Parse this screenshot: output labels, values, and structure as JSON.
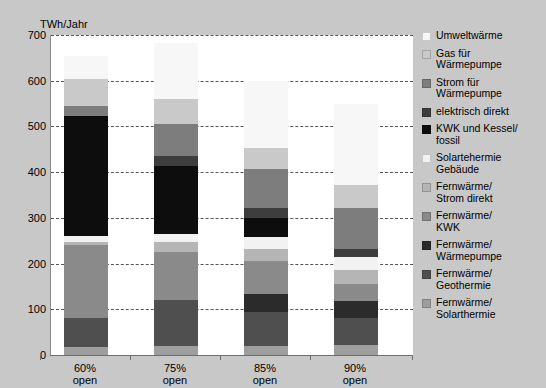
{
  "chart_data": {
    "type": "bar",
    "stacked": true,
    "title": "",
    "xlabel": "",
    "ylabel": "TWh/Jahr",
    "ylim": [
      0,
      700
    ],
    "ytick_step": 100,
    "yticks": [
      "700",
      "600",
      "500",
      "400",
      "300",
      "200",
      "100",
      "0"
    ],
    "grid": true,
    "legend_position": "right",
    "categories": [
      "60%\nopen",
      "75%\nopen",
      "85%\nopen",
      "90%\nopen"
    ],
    "category_labels": [
      {
        "line1": "60%",
        "line2": "open"
      },
      {
        "line1": "75%",
        "line2": "open"
      },
      {
        "line1": "85%",
        "line2": "open"
      },
      {
        "line1": "90%",
        "line2": "open"
      }
    ],
    "totals": [
      655,
      683,
      600,
      550
    ],
    "series": [
      {
        "name": "Fernwärme/\nSolarthermie",
        "color": "#9e9e9e",
        "values": [
          18,
          20,
          20,
          22
        ]
      },
      {
        "name": "Fernwärme/\nGeothermie",
        "color": "#4f4f4f",
        "values": [
          62,
          100,
          75,
          58
        ]
      },
      {
        "name": "Fernwärme/\nWärmepumpe",
        "color": "#2b2b2b",
        "values": [
          0,
          0,
          38,
          38
        ]
      },
      {
        "name": "Fernwärme/\nKWK",
        "color": "#8a8a8a",
        "values": [
          160,
          105,
          72,
          37
        ]
      },
      {
        "name": "Fernwärme/\nStrom direkt",
        "color": "#b5b5b5",
        "values": [
          8,
          22,
          28,
          32
        ]
      },
      {
        "name": "Solartehermie\nGebäude",
        "color": "#f2f2f2",
        "values": [
          12,
          18,
          25,
          28
        ]
      },
      {
        "name": "KWK und Kessel/\nfossil",
        "color": "#0d0d0d",
        "values": [
          262,
          148,
          42,
          0
        ]
      },
      {
        "name": "elektrisch direkt",
        "color": "#3d3d3d",
        "values": [
          0,
          22,
          22,
          18
        ]
      },
      {
        "name": "Strom für\nWärmepumpe",
        "color": "#7d7d7d",
        "values": [
          23,
          70,
          85,
          88
        ]
      },
      {
        "name": "Gas für\nWärmepumpe",
        "color": "#c9c9c9",
        "values": [
          58,
          55,
          45,
          52
        ]
      },
      {
        "name": "Umweltwärme",
        "color": "#f7f7f7",
        "values": [
          52,
          123,
          148,
          177
        ]
      }
    ],
    "legend_order": [
      "Umweltwärme",
      "Gas für\nWärmepumpe",
      "Strom für\nWärmepumpe",
      "elektrisch direkt",
      "KWK und Kessel/\nfossil",
      "Solartehermie\nGebäude",
      "Fernwärme/\nStrom direkt",
      "Fernwärme/\nKWK",
      "Fernwärme/\nWärmepumpe",
      "Fernwärme/\nGeothermie",
      "Fernwärme/\nSolarthermie"
    ]
  },
  "colors": {
    "background": "#c8c8c8",
    "panel": "#ffffff",
    "axis": "#6e6e6e",
    "grid": "#555555",
    "text": "#000000"
  }
}
